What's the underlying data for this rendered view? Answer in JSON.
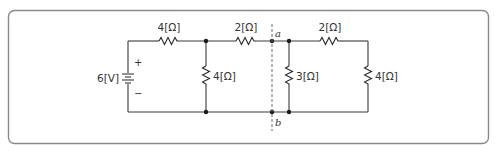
{
  "diagram": {
    "type": "circuit-schematic",
    "source": {
      "label": "6[V]",
      "plus": "+",
      "minus": "−"
    },
    "resistors": [
      {
        "id": "R1",
        "label": "4[Ω]",
        "orientation": "horizontal",
        "position": "top-left series"
      },
      {
        "id": "R2",
        "label": "4[Ω]",
        "orientation": "vertical",
        "position": "left shunt"
      },
      {
        "id": "R3",
        "label": "2[Ω]",
        "orientation": "horizontal",
        "position": "top-middle series"
      },
      {
        "id": "R4",
        "label": "3[Ω]",
        "orientation": "vertical",
        "position": "right shunt"
      },
      {
        "id": "R5",
        "label": "2[Ω]",
        "orientation": "horizontal",
        "position": "top-right series"
      },
      {
        "id": "R6",
        "label": "4[Ω]",
        "orientation": "vertical",
        "position": "right end"
      }
    ],
    "terminals": {
      "a": "a",
      "b": "b"
    },
    "cut_line": "dashed vertical line through terminals a and b"
  },
  "colors": {
    "wire": "#3a3a3a",
    "frame": "#8a8a8a",
    "text": "#333333"
  }
}
